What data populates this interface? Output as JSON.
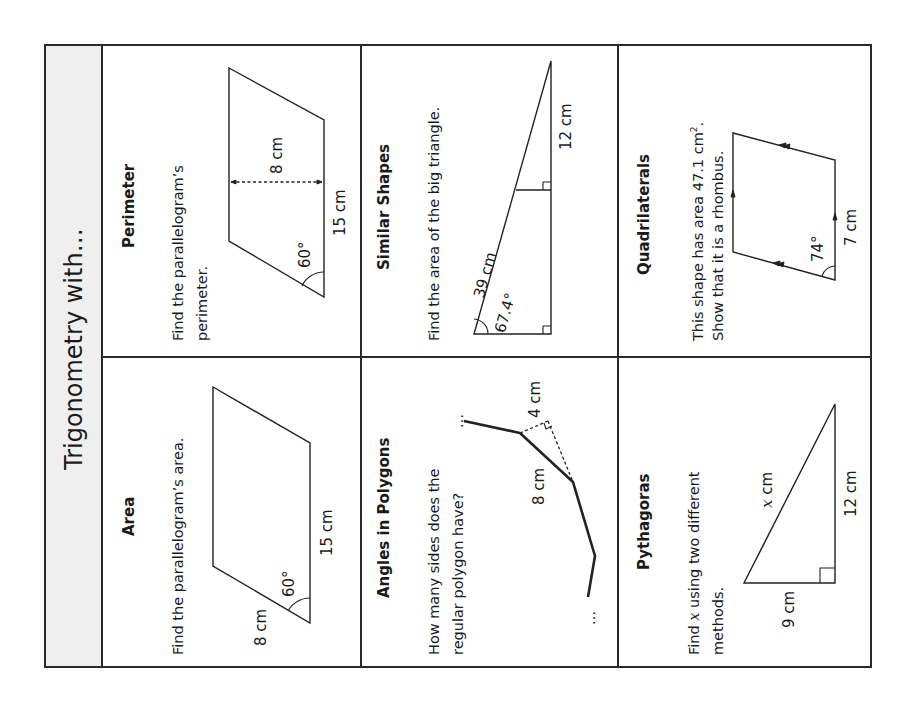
{
  "worksheet": {
    "title": "Trigonometry with…",
    "cells": [
      {
        "id": "area",
        "heading": "Area",
        "question_lines": [
          "Find the parallelogram’s area."
        ],
        "labels": {
          "side_a": "8 cm",
          "side_b": "15 cm",
          "angle": "60°"
        }
      },
      {
        "id": "perimeter",
        "heading": "Perimeter",
        "question_lines": [
          "Find the parallelogram’s",
          "perimeter."
        ],
        "labels": {
          "height": "8 cm",
          "base": "15 cm",
          "angle": "60°"
        }
      },
      {
        "id": "angles-in-polygons",
        "heading": "Angles in Polygons",
        "question_lines": [
          "How many sides does the",
          "regular polygon have?"
        ],
        "labels": {
          "side": "8 cm",
          "perpendicular": "4 cm",
          "ellipsis_start": "…",
          "ellipsis_end": "…"
        }
      },
      {
        "id": "similar-shapes",
        "heading": "Similar Shapes",
        "question_lines": [
          "Find the area of the big triangle."
        ],
        "labels": {
          "hypotenuse": "39 cm",
          "angle": "67.4°",
          "small_side": "12 cm"
        }
      },
      {
        "id": "pythagoras",
        "heading": "Pythagoras",
        "question_prefix": "Find ",
        "question_var": "x",
        "question_suffix": " using two different",
        "question_line2": "methods.",
        "labels": {
          "hyp_var": "x",
          "hyp_unit": " cm",
          "leg_a": "9 cm",
          "leg_b": "12 cm"
        }
      },
      {
        "id": "quadrilaterals",
        "heading": "Quadrilaterals",
        "question_line1_prefix": "This shape has area 47.1 cm",
        "question_line1_sup": "2",
        "question_line1_suffix": ".",
        "question_line2": "Show that it is a rhombus.",
        "labels": {
          "side": "7 cm",
          "angle": "74°"
        }
      }
    ]
  }
}
